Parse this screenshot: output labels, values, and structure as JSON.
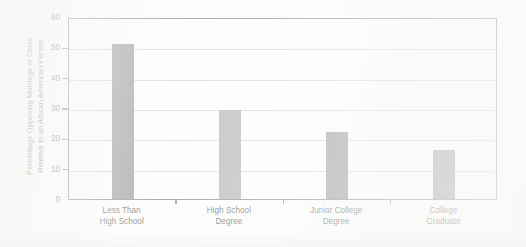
{
  "chart_data": {
    "type": "bar",
    "title": "",
    "xlabel": "",
    "ylabel_line1": "Percentage Opposing Marriage of Close",
    "ylabel_line2": "Relative to an African American Person",
    "categories": [
      "Less Than\nHigh School",
      "High School\nDegree",
      "Junior College\nDegree",
      "College\nGraduate"
    ],
    "category_lines": [
      [
        "Less Than",
        "High School"
      ],
      [
        "High School",
        "Degree"
      ],
      [
        "Junior College",
        "Degree"
      ],
      [
        "College",
        "Graduate"
      ]
    ],
    "values": [
      51,
      29.5,
      22,
      16
    ],
    "bar_colors": [
      "#6e6e6e",
      "#949494",
      "#6e6e6e",
      "#717171"
    ],
    "ylim": [
      0,
      60
    ],
    "yticks": [
      0,
      10,
      20,
      30,
      40,
      50,
      60
    ],
    "ytick_labels": [
      "0",
      "10",
      "20",
      "30",
      "40",
      "50",
      "60"
    ],
    "grid": true,
    "grid_color": "#c6c6c6",
    "legend": "none",
    "frame_color": "#58585a",
    "background": "#ffffff"
  }
}
